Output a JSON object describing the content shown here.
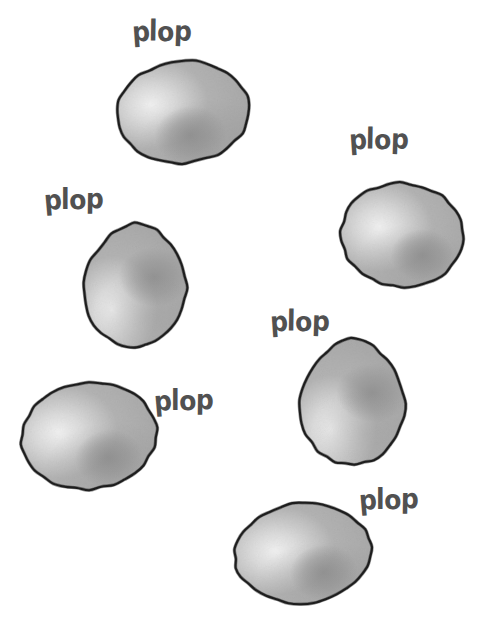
{
  "canvas": {
    "width": 485,
    "height": 635,
    "background_color": "#ffffff",
    "style": "hand-drawn comic illustration"
  },
  "palette": {
    "outline": "#1d1d1d",
    "fill_base": "#b4b4b4",
    "fill_highlight": "#f2f2f2",
    "fill_shadow": "#8d8d8d",
    "text": "#515151",
    "background": "#ffffff"
  },
  "sound_effects": [
    {
      "id": "sfx-1",
      "text": "plop",
      "x": 132,
      "y": 19,
      "size": 25,
      "rotate": -1
    },
    {
      "id": "sfx-2",
      "text": "plop",
      "x": 44,
      "y": 187,
      "size": 25,
      "rotate": -2
    },
    {
      "id": "sfx-3",
      "text": "plop",
      "x": 349,
      "y": 127,
      "size": 25,
      "rotate": -1
    },
    {
      "id": "sfx-4",
      "text": "plop",
      "x": 154,
      "y": 388,
      "size": 25,
      "rotate": -2
    },
    {
      "id": "sfx-5",
      "text": "plop",
      "x": 270,
      "y": 309,
      "size": 25,
      "rotate": -1
    },
    {
      "id": "sfx-6",
      "text": "plop",
      "x": 359,
      "y": 487,
      "size": 25,
      "rotate": -2
    }
  ],
  "blobs": [
    {
      "id": "blob-1",
      "label": "blob-top-left",
      "x": 114,
      "y": 58,
      "w": 138,
      "h": 108,
      "shape": "oval",
      "rotate": -6,
      "highlight": {
        "cx": 36,
        "cy": 42,
        "r": 32
      },
      "shadow": {
        "cx": 74,
        "cy": 78,
        "r": 36
      }
    },
    {
      "id": "blob-2",
      "label": "blob-mid-left",
      "x": 80,
      "y": 220,
      "w": 110,
      "h": 130,
      "shape": "egg",
      "rotate": 3,
      "highlight": {
        "cx": 32,
        "cy": 92,
        "r": 26
      },
      "shadow": {
        "cx": 74,
        "cy": 56,
        "r": 36
      }
    },
    {
      "id": "blob-3",
      "label": "blob-mid-right",
      "x": 338,
      "y": 180,
      "w": 128,
      "h": 110,
      "shape": "oval",
      "rotate": 4,
      "highlight": {
        "cx": 40,
        "cy": 48,
        "r": 30
      },
      "shadow": {
        "cx": 86,
        "cy": 74,
        "r": 32
      }
    },
    {
      "id": "blob-4",
      "label": "blob-bottom-left",
      "x": 18,
      "y": 380,
      "w": 142,
      "h": 112,
      "shape": "oval",
      "rotate": -7,
      "highlight": {
        "cx": 40,
        "cy": 48,
        "r": 30
      },
      "shadow": {
        "cx": 88,
        "cy": 80,
        "r": 34
      }
    },
    {
      "id": "blob-5",
      "label": "blob-lower-right",
      "x": 296,
      "y": 336,
      "w": 112,
      "h": 132,
      "shape": "egg",
      "rotate": 2,
      "highlight": {
        "cx": 34,
        "cy": 96,
        "r": 24
      },
      "shadow": {
        "cx": 76,
        "cy": 56,
        "r": 36
      }
    },
    {
      "id": "blob-6",
      "label": "blob-bottom-right",
      "x": 232,
      "y": 500,
      "w": 142,
      "h": 106,
      "shape": "oval",
      "rotate": -5,
      "highlight": {
        "cx": 42,
        "cy": 48,
        "r": 28
      },
      "shadow": {
        "cx": 90,
        "cy": 74,
        "r": 34
      }
    }
  ]
}
